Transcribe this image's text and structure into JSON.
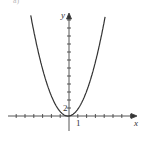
{
  "chart_data": {
    "type": "line",
    "title": "",
    "xlabel": "x",
    "ylabel": "y",
    "tick_labels": {
      "x": "1",
      "y": "2"
    },
    "x_tick_unit": 1,
    "y_tick_unit": 2,
    "xlim": [
      -6.5,
      8.5
    ],
    "ylim": [
      -4,
      26
    ],
    "grid": false,
    "legend": null,
    "series": [
      {
        "name": "curve",
        "formula": "y = 1.4x^2 + 0.3x",
        "color": "#333333",
        "x": [
          -4.8,
          -4,
          -3,
          -2,
          -1,
          -0.5,
          0,
          0.5,
          1,
          2,
          3,
          4.3
        ],
        "y": [
          30.8,
          21.2,
          11.7,
          5.0,
          1.1,
          0.2,
          0,
          0.5,
          1.7,
          6.2,
          13.5,
          27.2
        ]
      }
    ]
  },
  "labels": {
    "x_axis": "x",
    "y_axis": "y",
    "x_tick": "1",
    "y_tick": "2",
    "cut_text": "a)"
  }
}
